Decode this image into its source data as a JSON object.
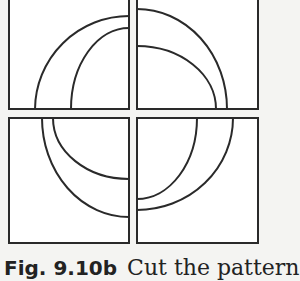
{
  "figure": {
    "stroke_color": "#2a2a2a",
    "panel_fill": "#ffffff",
    "panels": [
      {
        "id": "top-left",
        "x": 9,
        "y": -2,
        "w": 120,
        "h": 111,
        "arcs": [
          {
            "name": "outer",
            "d": "M 35 109 A 94 94 0 0 1 129 16"
          },
          {
            "name": "inner",
            "d": "M 71 109 A 58 81 0 0 1 129 28"
          }
        ]
      },
      {
        "id": "top-right",
        "x": 137,
        "y": -2,
        "w": 121,
        "h": 111,
        "arcs": [
          {
            "name": "outer",
            "d": "M 137 9 A 90 100 0 0 1 227 109"
          },
          {
            "name": "inner",
            "d": "M 137 46 A 79 63 0 0 1 216 109"
          }
        ]
      },
      {
        "id": "bottom-left",
        "x": 9,
        "y": 118,
        "w": 120,
        "h": 125,
        "arcs": [
          {
            "name": "outer",
            "d": "M 42 118 A 87 99 0 0 0 129 217"
          },
          {
            "name": "inner",
            "d": "M 53 118 A 76 61 0 0 0 129 179"
          }
        ]
      },
      {
        "id": "bottom-right",
        "x": 137,
        "y": 118,
        "w": 121,
        "h": 125,
        "arcs": [
          {
            "name": "inner",
            "d": "M 197 118 A 60 81 0 0 1 137 199"
          },
          {
            "name": "outer",
            "d": "M 233 118 A 96 92 0 0 1 137 210"
          }
        ]
      }
    ]
  },
  "caption": {
    "label": "Fig. 9.10b",
    "text": "Cut the pattern"
  }
}
